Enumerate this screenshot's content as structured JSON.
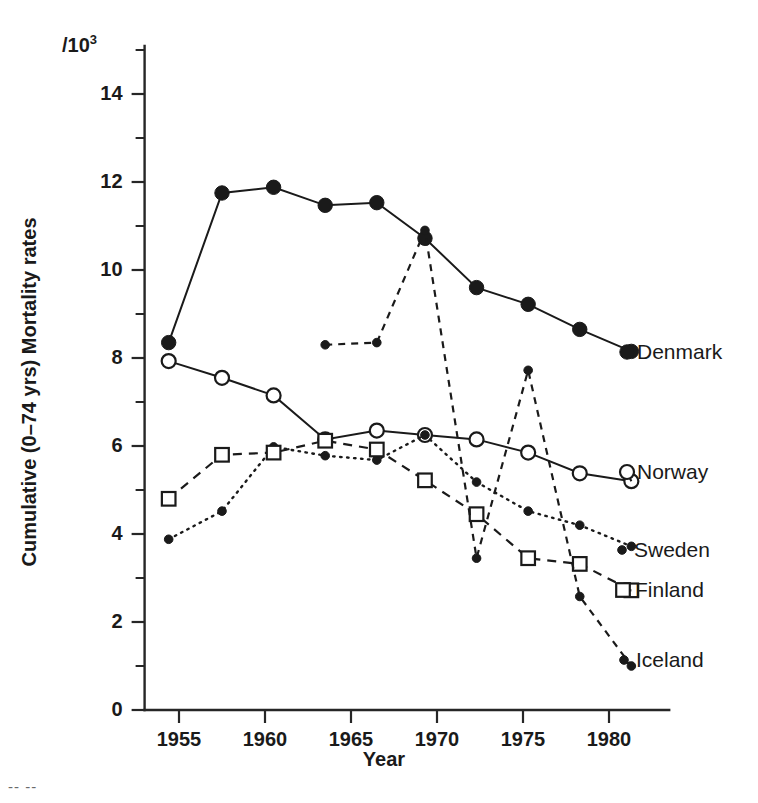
{
  "chart_data": {
    "type": "line",
    "title": "",
    "xlabel": "Year",
    "ylabel": "Cumulative (0–74 yrs) Mortality rates",
    "unit_note": "/10",
    "unit_exponent": "3",
    "xlim": [
      1953.0,
      1983.5
    ],
    "ylim": [
      0,
      15
    ],
    "grid": false,
    "legend_position": "right-inline",
    "x_ticks": [
      1955,
      1960,
      1965,
      1970,
      1975,
      1980
    ],
    "x_tick_labels": [
      "1955",
      "1960",
      "1965",
      "1970",
      "1975",
      "1980"
    ],
    "x_minor_ticks": [],
    "y_ticks": [
      0,
      2,
      4,
      6,
      8,
      10,
      12,
      14
    ],
    "y_tick_labels": [
      "0",
      "2",
      "4",
      "6",
      "8",
      "10",
      "12",
      "14"
    ],
    "y_minor_ticks": [
      1,
      3,
      5,
      7,
      9,
      11,
      13,
      15
    ],
    "series": [
      {
        "name": "Denmark",
        "marker": "filled-circle",
        "line": "solid",
        "x": [
          1954.4,
          1957.5,
          1960.5,
          1963.5,
          1966.5,
          1969.3,
          1972.3,
          1975.3,
          1978.3,
          1981.3
        ],
        "values": [
          8.35,
          11.75,
          11.88,
          11.47,
          11.53,
          10.72,
          9.6,
          9.22,
          8.65,
          8.15
        ]
      },
      {
        "name": "Norway",
        "marker": "open-circle",
        "line": "solid",
        "x": [
          1954.4,
          1957.5,
          1960.5,
          1963.5,
          1966.5,
          1969.3,
          1972.3,
          1975.3,
          1978.3,
          1981.3
        ],
        "values": [
          7.93,
          7.55,
          7.15,
          6.15,
          6.35,
          6.25,
          6.15,
          5.85,
          5.38,
          5.2
        ]
      },
      {
        "name": "Sweden",
        "marker": "small-filled-circle",
        "line": "dotted",
        "x": [
          1954.4,
          1957.5,
          1960.5,
          1963.5,
          1966.5,
          1969.3,
          1972.3,
          1975.3,
          1978.3,
          1981.3
        ],
        "values": [
          3.88,
          4.52,
          5.98,
          5.78,
          5.68,
          6.25,
          5.18,
          4.52,
          4.2,
          3.72
        ]
      },
      {
        "name": "Finland",
        "marker": "open-square",
        "line": "dashed",
        "x": [
          1954.4,
          1957.5,
          1960.5,
          1963.5,
          1966.5,
          1969.3,
          1972.3,
          1975.3,
          1978.3,
          1981.3
        ],
        "values": [
          4.8,
          5.8,
          5.85,
          6.12,
          5.92,
          5.22,
          4.45,
          3.45,
          3.32,
          2.72
        ]
      },
      {
        "name": "Iceland",
        "marker": "small-filled-circle",
        "line": "dashed-short",
        "x": [
          1963.5,
          1966.5,
          1969.3,
          1972.3,
          1975.3,
          1978.3,
          1981.3
        ],
        "values": [
          8.3,
          8.35,
          10.9,
          3.45,
          7.72,
          2.58,
          1.0
        ]
      }
    ],
    "series_labels": [
      {
        "name": "Denmark",
        "marker": "filled-circle",
        "label": "Denmark"
      },
      {
        "name": "Norway",
        "marker": "open-circle",
        "label": "Norway"
      },
      {
        "name": "Sweden",
        "marker": "small-filled-circle",
        "label": "Sweden"
      },
      {
        "name": "Finland",
        "marker": "open-square",
        "label": "Finland"
      },
      {
        "name": "Iceland",
        "marker": "small-filled-circle",
        "label": "Iceland"
      }
    ],
    "colors": {
      "ink": "#1a1a1a",
      "background": "#ffffff"
    }
  },
  "figure": {
    "page_artifact": "-- --"
  }
}
